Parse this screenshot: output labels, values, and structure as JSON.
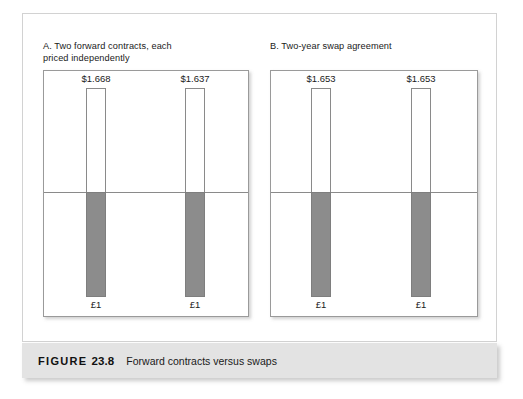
{
  "figure": {
    "caption_prefix": "FIGURE",
    "caption_number": "23.8",
    "caption_text": "Forward contracts versus swaps"
  },
  "panels": [
    {
      "title": "A. Two forward contracts, each\npriced independently",
      "bars": [
        {
          "value_label": "$1.668",
          "base_label": "£1"
        },
        {
          "value_label": "$1.637",
          "base_label": "£1"
        }
      ]
    },
    {
      "title": "B. Two-year swap agreement",
      "bars": [
        {
          "value_label": "$1.653",
          "base_label": "£1"
        },
        {
          "value_label": "$1.653",
          "base_label": "£1"
        }
      ]
    }
  ],
  "chart_data": {
    "type": "bar",
    "title": "Forward contracts versus swaps",
    "subtitle": "FIGURE 23.8",
    "orientation": "vertical-diverging",
    "panels": [
      {
        "name": "A. Two forward contracts, each priced independently",
        "categories": [
          "Year 1",
          "Year 2"
        ],
        "series": [
          {
            "name": "Dollars received (up)",
            "labels": [
              "$1.668",
              "$1.637"
            ],
            "values": [
              1.668,
              1.637
            ],
            "direction": "up",
            "fill": "white"
          },
          {
            "name": "Pounds paid (down)",
            "labels": [
              "£1",
              "£1"
            ],
            "values": [
              1.0,
              1.0
            ],
            "direction": "down",
            "fill": "gray"
          }
        ]
      },
      {
        "name": "B. Two-year swap agreement",
        "categories": [
          "Year 1",
          "Year 2"
        ],
        "series": [
          {
            "name": "Dollars received (up)",
            "labels": [
              "$1.653",
              "$1.653"
            ],
            "values": [
              1.653,
              1.653
            ],
            "direction": "up",
            "fill": "white"
          },
          {
            "name": "Pounds paid (down)",
            "labels": [
              "£1",
              "£1"
            ],
            "values": [
              1.0,
              1.0
            ],
            "direction": "down",
            "fill": "gray"
          }
        ]
      }
    ],
    "xlabel": "",
    "ylabel": "",
    "grid": false,
    "legend": "none",
    "zero_line": true
  },
  "colors": {
    "bar_fill_gray": "#8c8c8c",
    "bar_outline": "#8a8a8a",
    "panel_border": "#9a9a9a",
    "outer_frame_border": "#d2d2d2",
    "caption_band": "#e3e3e3",
    "text": "#1a1a1a"
  }
}
